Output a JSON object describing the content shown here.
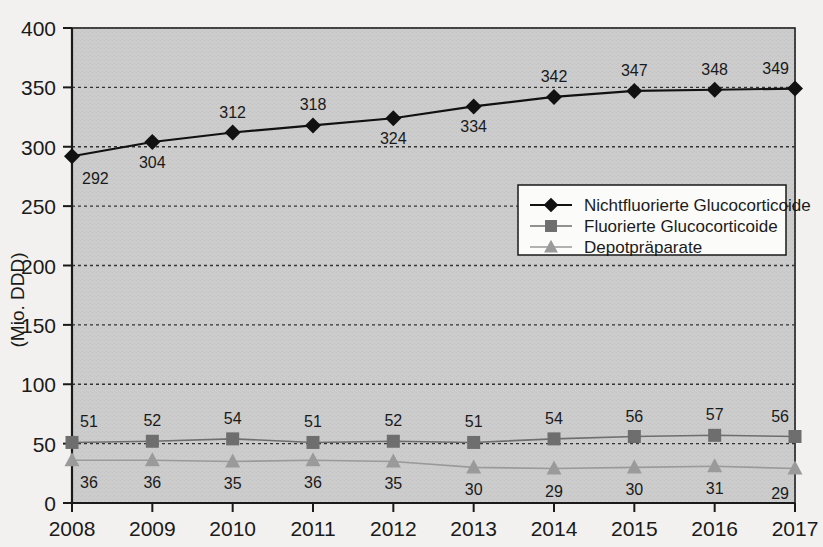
{
  "chart_data": {
    "type": "line",
    "title": "",
    "subtitle": "",
    "xlabel": "",
    "ylabel": "(Mio. DDD)",
    "categories": [
      "2008",
      "2009",
      "2010",
      "2011",
      "2012",
      "2013",
      "2014",
      "2015",
      "2016",
      "2017"
    ],
    "x": [
      2008,
      2009,
      2010,
      2011,
      2012,
      2013,
      2014,
      2015,
      2016,
      2017
    ],
    "ylim": [
      0,
      400
    ],
    "yticks": [
      0,
      50,
      100,
      150,
      200,
      250,
      300,
      350,
      400
    ],
    "ytick_labels": [
      "0",
      "50",
      "100",
      "150",
      "200",
      "250",
      "300",
      "350",
      "400"
    ],
    "grid": true,
    "grid_style": "dashed horizontal",
    "legend_position": "center-right-inside",
    "series": [
      {
        "name": "Nichtfluorierte Glucocorticoide",
        "marker": "diamond",
        "color": "#111111",
        "values": [
          292,
          304,
          312,
          318,
          324,
          334,
          342,
          347,
          348,
          349
        ],
        "labels": [
          "292",
          "304",
          "312",
          "318",
          "324",
          "334",
          "342",
          "347",
          "348",
          "349"
        ]
      },
      {
        "name": "Fluorierte Glucocorticoide",
        "marker": "square",
        "color": "#6e6e6e",
        "values": [
          51,
          52,
          54,
          51,
          52,
          51,
          54,
          56,
          57,
          56
        ],
        "labels": [
          "51",
          "52",
          "54",
          "51",
          "52",
          "51",
          "54",
          "56",
          "57",
          "56"
        ]
      },
      {
        "name": "Depotpräparate",
        "marker": "triangle",
        "color": "#9a9a9a",
        "values": [
          36,
          36,
          35,
          36,
          35,
          30,
          29,
          30,
          31,
          29
        ],
        "labels": [
          "36",
          "36",
          "35",
          "36",
          "35",
          "30",
          "29",
          "30",
          "31",
          "29"
        ]
      }
    ]
  },
  "colors": {
    "page_background": "#f3f1ef",
    "plot_background": "#c9c9c9",
    "axis": "#1a1a1a",
    "grid": "#333333",
    "series_1": "#111111",
    "series_2": "#6e6e6e",
    "series_3": "#9a9a9a",
    "legend_background": "#fbfbfa",
    "legend_border": "#1a1a1a"
  }
}
